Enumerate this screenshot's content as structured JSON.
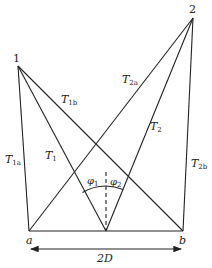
{
  "diagram": {
    "points": {
      "p1": {
        "label": "1",
        "x": 18,
        "y": 66
      },
      "p2": {
        "label": "2",
        "x": 193,
        "y": 18
      },
      "a": {
        "label": "a",
        "x": 29,
        "y": 231
      },
      "b": {
        "label": "b",
        "x": 183,
        "y": 231
      },
      "m": {
        "label": "",
        "x": 106,
        "y": 231
      }
    },
    "labels": {
      "T1a": {
        "main": "T",
        "sub": "1a"
      },
      "T1b": {
        "main": "T",
        "sub": "1b"
      },
      "T1": {
        "main": "T",
        "sub": "1"
      },
      "T2a": {
        "main": "T",
        "sub": "2a"
      },
      "T2b": {
        "main": "T",
        "sub": "2b"
      },
      "T2": {
        "main": "T",
        "sub": "2"
      },
      "phi1": {
        "main": "φ",
        "sub": "1"
      },
      "phi2": {
        "main": "φ",
        "sub": "2"
      },
      "baseline": "2D"
    },
    "edges": [
      {
        "from": "p1",
        "to": "a",
        "name": "T1a"
      },
      {
        "from": "p1",
        "to": "b",
        "name": "T1b"
      },
      {
        "from": "p1",
        "to": "m",
        "name": "T1"
      },
      {
        "from": "p2",
        "to": "a",
        "name": "T2a"
      },
      {
        "from": "p2",
        "to": "b",
        "name": "T2b"
      },
      {
        "from": "p2",
        "to": "m",
        "name": "T2"
      },
      {
        "from": "a",
        "to": "b",
        "name": "baseline"
      }
    ]
  }
}
